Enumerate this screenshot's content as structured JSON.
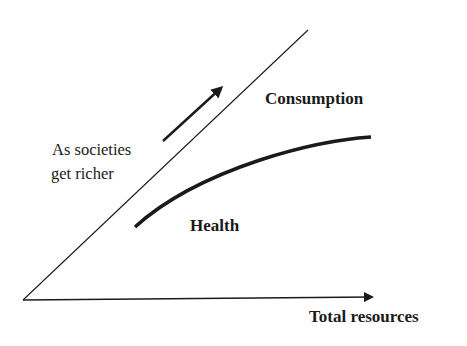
{
  "diagram": {
    "labels": {
      "consumption": "Consumption",
      "health": "Health",
      "x_axis": "Total resources",
      "annotation_line1": "As societies",
      "annotation_line2": "get richer"
    },
    "colors": {
      "ink": "#1a1a1a",
      "background": "#ffffff"
    },
    "elements": {
      "diagonal_line": {
        "from": [
          23,
          300
        ],
        "to": [
          308,
          30
        ]
      },
      "x_axis_arrow": {
        "from": [
          23,
          300
        ],
        "to": [
          381,
          297
        ]
      },
      "boundary_curve": {
        "from": [
          135,
          227
        ],
        "to": [
          370,
          137
        ]
      },
      "direction_arrow": {
        "from": [
          163,
          141
        ],
        "to": [
          226,
          83
        ]
      }
    }
  }
}
